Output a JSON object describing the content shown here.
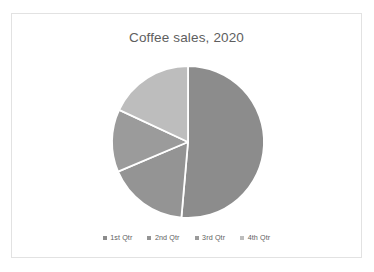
{
  "chart_data": {
    "type": "pie",
    "title": "Coffee sales, 2020",
    "categories": [
      "1st Qtr",
      "2nd Qtr",
      "3rd Qtr",
      "4th Qtr"
    ],
    "values": [
      51.4,
      17.2,
      13.3,
      18.1
    ],
    "colors": [
      "#8c8c8c",
      "#949494",
      "#9b9b9b",
      "#bdbdbd"
    ],
    "slice_start_angles_deg": [
      0,
      185,
      247,
      295
    ],
    "slice_end_angles_deg": [
      185,
      247,
      295,
      360
    ],
    "legend_position": "bottom",
    "grid": false,
    "labels_shown": false,
    "slice_border_color": "#ffffff",
    "center_x": 188,
    "center_y": 142,
    "radius": 76
  },
  "card": {
    "border_color": "#e2e2e2",
    "background": "#ffffff"
  },
  "title": {
    "text": "Coffee sales, 2020",
    "color": "#5e5e5e"
  },
  "legend": {
    "items": [
      {
        "label": "1st Qtr",
        "color": "#8c8c8c"
      },
      {
        "label": "2nd Qtr",
        "color": "#949494"
      },
      {
        "label": "3rd Qtr",
        "color": "#9b9b9b"
      },
      {
        "label": "4th Qtr",
        "color": "#bdbdbd"
      }
    ]
  }
}
